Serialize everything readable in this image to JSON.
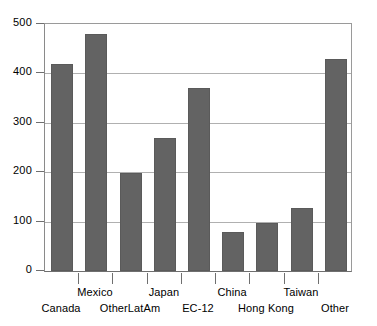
{
  "chart_data": {
    "type": "bar",
    "title": "",
    "subtitle": "",
    "xlabel": "",
    "ylabel": "",
    "ylim": [
      0,
      500
    ],
    "ytick_step": 100,
    "grid": true,
    "legend": false,
    "bar_color": "#636363",
    "categories": [
      "Canada",
      "Mexico",
      "OtherLatAm",
      "Japan",
      "EC-12",
      "China",
      "Hong Kong",
      "Taiwan",
      "Other"
    ],
    "values": [
      420,
      480,
      198,
      270,
      370,
      78,
      98,
      128,
      430
    ],
    "yticks": [
      "0",
      "100",
      "200",
      "300",
      "400",
      "500"
    ],
    "ytick_values": [
      0,
      100,
      200,
      300,
      400,
      500
    ],
    "label_rows": [
      "bottom",
      "top",
      "bottom",
      "top",
      "bottom",
      "top",
      "bottom",
      "top",
      "bottom"
    ]
  }
}
